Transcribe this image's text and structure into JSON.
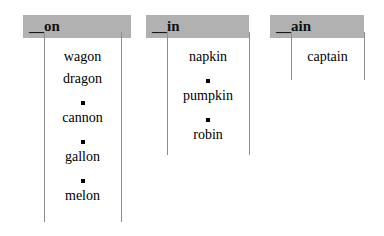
{
  "worksheet": {
    "title": "Word sort by rime pattern",
    "background_color": "#ffffff",
    "header_fill": "#b1b1b1",
    "rule_color": "#8e8e8e",
    "bullet_glyph": "black-square"
  },
  "columns": [
    {
      "id": "column-on",
      "header": "__on",
      "entries": [
        {
          "type": "word",
          "text": "wagon"
        },
        {
          "type": "word",
          "text": "dragon"
        },
        {
          "type": "bullet",
          "text": "■"
        },
        {
          "type": "word",
          "text": "cannon"
        },
        {
          "type": "bullet",
          "text": "■"
        },
        {
          "type": "word",
          "text": "gallon"
        },
        {
          "type": "bullet",
          "text": "■"
        },
        {
          "type": "word",
          "text": "melon"
        }
      ]
    },
    {
      "id": "column-in",
      "header": "__in",
      "entries": [
        {
          "type": "word",
          "text": "napkin"
        },
        {
          "type": "bullet",
          "text": "■"
        },
        {
          "type": "word",
          "text": "pumpkin"
        },
        {
          "type": "bullet",
          "text": "■"
        },
        {
          "type": "word",
          "text": "robin"
        }
      ]
    },
    {
      "id": "column-ain",
      "header": "__ain",
      "entries": [
        {
          "type": "word",
          "text": "captain"
        }
      ]
    }
  ]
}
